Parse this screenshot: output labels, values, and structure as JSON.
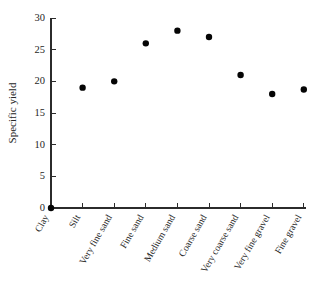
{
  "chart_data": {
    "type": "scatter",
    "title": "",
    "subtitle": "",
    "xlabel": "",
    "ylabel": "Specific yield",
    "categories": [
      "Clay",
      "Silt",
      "Very fine sand",
      "Fine sand",
      "Medium sand",
      "Coarse sand",
      "Very coarse sand",
      "Very fine gravel",
      "Fine gravel"
    ],
    "values": [
      0,
      19,
      20,
      26,
      28,
      27,
      21,
      18,
      18.7
    ],
    "ylim": [
      0,
      30
    ],
    "yticks": [
      0,
      5,
      10,
      15,
      20,
      25,
      30
    ],
    "ytick_labels": [
      "0",
      "5",
      "10",
      "15",
      "20",
      "25",
      "30"
    ],
    "grid": false,
    "legend": false,
    "legend_position": "none",
    "marker": "filled-circle",
    "marker_color": "#050505",
    "axis_color": "#2b2b2b",
    "background_color": "#ffffff",
    "xtick_label_rotation": -60
  }
}
